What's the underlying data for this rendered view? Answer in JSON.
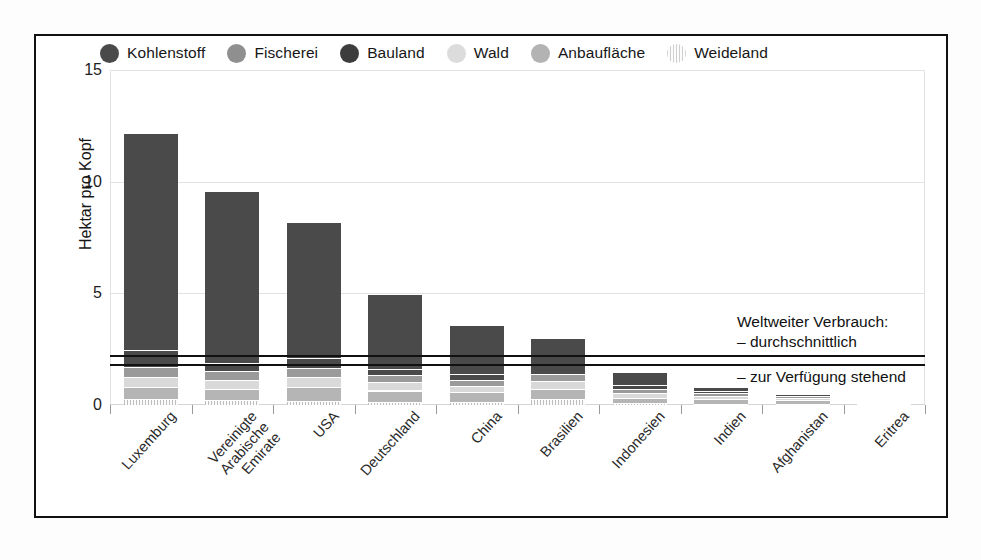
{
  "chart_data": {
    "type": "bar",
    "subtype": "stacked-vertical",
    "title": "",
    "xlabel": "",
    "ylabel": "Hektar pro Kopf",
    "ylim": [
      0,
      15
    ],
    "yticks": [
      0,
      5,
      10,
      15
    ],
    "grid": true,
    "legend_position": "top",
    "categories": [
      "Luxemburg",
      "Vereinigte Arabische Emirate",
      "USA",
      "Deutschland",
      "China",
      "Brasilien",
      "Indonesien",
      "Indien",
      "Afghanistan",
      "Eritrea"
    ],
    "category_lines": [
      [
        "Luxemburg"
      ],
      [
        "Vereinigte",
        "Arabische",
        "Emirate"
      ],
      [
        "USA"
      ],
      [
        "Deutschland"
      ],
      [
        "China"
      ],
      [
        "Brasilien"
      ],
      [
        "Indonesien"
      ],
      [
        "Indien"
      ],
      [
        "Afghanistan"
      ],
      [
        "Eritrea"
      ]
    ],
    "series": [
      {
        "name": "Weideland",
        "color": "#f2f2f2",
        "pattern": "vertical-hatch",
        "values": [
          0.25,
          0.22,
          0.2,
          0.15,
          0.12,
          0.28,
          0.08,
          0.06,
          0.05,
          0.04
        ]
      },
      {
        "name": "Anbaufläche",
        "color": "#b5b5b5",
        "pattern": "solid",
        "values": [
          0.55,
          0.5,
          0.6,
          0.5,
          0.45,
          0.45,
          0.25,
          0.22,
          0.18,
          0.06
        ]
      },
      {
        "name": "Wald",
        "color": "#d9d9d9",
        "pattern": "solid",
        "values": [
          0.45,
          0.42,
          0.45,
          0.38,
          0.3,
          0.35,
          0.22,
          0.14,
          0.1,
          0.04
        ]
      },
      {
        "name": "Fischerei",
        "color": "#9a9a9a",
        "pattern": "solid",
        "values": [
          0.45,
          0.38,
          0.4,
          0.3,
          0.25,
          0.3,
          0.18,
          0.1,
          0.07,
          0.03
        ]
      },
      {
        "name": "Bauland",
        "color": "#4a4a4a",
        "pattern": "solid",
        "values": [
          0.75,
          0.35,
          0.45,
          0.3,
          0.28,
          0.4,
          0.18,
          0.1,
          0.08,
          0.03
        ]
      },
      {
        "name": "Kohlenstoff",
        "color": "#4a4a4a",
        "pattern": "solid",
        "values": [
          9.75,
          7.7,
          6.1,
          3.35,
          2.2,
          1.2,
          0.58,
          0.2,
          0.04,
          0.0
        ]
      }
    ],
    "totals": [
      12.2,
      9.57,
      8.2,
      4.98,
      3.6,
      2.98,
      1.49,
      0.82,
      0.52,
      0.2
    ],
    "reference_lines": [
      {
        "label": "durchschnittlich",
        "value": 2.2
      },
      {
        "label": "zur Verfügung stehend",
        "value": 1.8
      }
    ],
    "annotations": {
      "heading": "Weltweiter Verbrauch:",
      "line_avg": "– durchschnittlich",
      "line_available": "– zur Verfügung stehend"
    }
  },
  "legend": {
    "items": [
      {
        "label": "Kohlenstoff",
        "color": "#4a4a4a",
        "pattern": "solid"
      },
      {
        "label": "Fischerei",
        "color": "#8f8f8f",
        "pattern": "solid"
      },
      {
        "label": "Bauland",
        "color": "#3d3d3d",
        "pattern": "solid"
      },
      {
        "label": "Wald",
        "color": "#dcdcdc",
        "pattern": "solid"
      },
      {
        "label": "Anbaufläche",
        "color": "#b3b3b3",
        "pattern": "solid"
      },
      {
        "label": "Weideland",
        "color": "#f0f0f0",
        "pattern": "vertical-hatch"
      }
    ]
  },
  "axis": {
    "y_label": "Hektar pro Kopf",
    "y_ticks": [
      "15",
      "10",
      "5",
      "0"
    ]
  },
  "colors": {
    "frame": "#111111",
    "grid": "#e2e2e2",
    "reference_line": "#111111"
  }
}
